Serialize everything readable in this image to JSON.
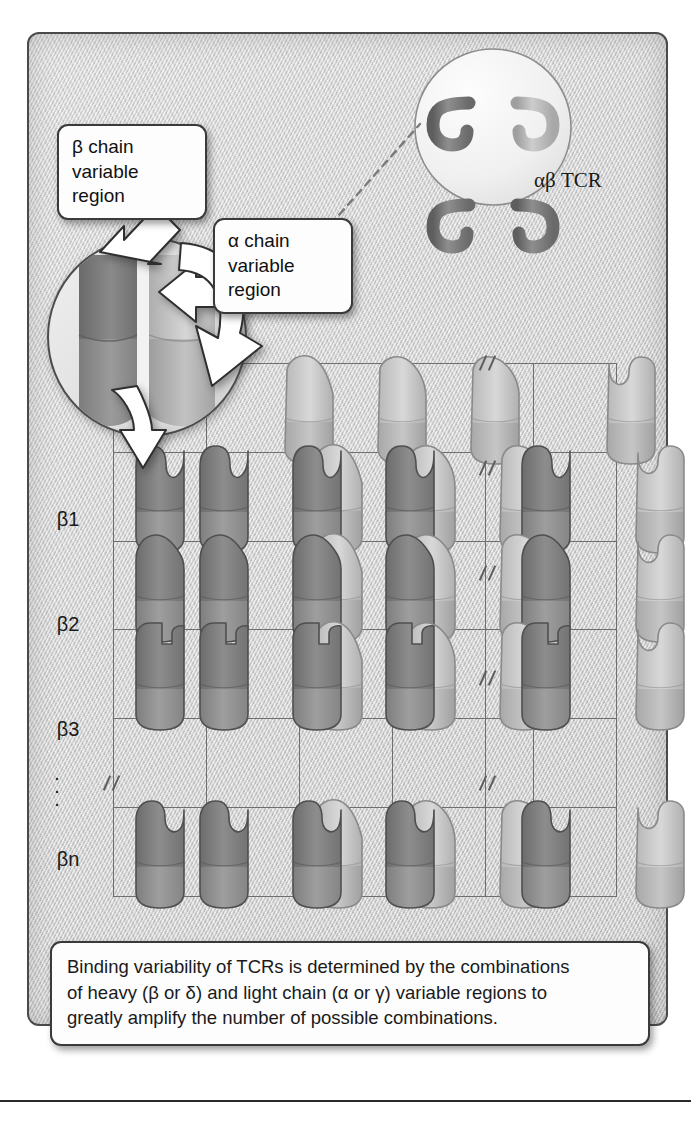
{
  "figure": {
    "tcr_label": "αβ TCR",
    "callouts": [
      {
        "id": "beta-chain-variable-region",
        "line1": "β chain",
        "line2": "variable",
        "line3": "region"
      },
      {
        "id": "alpha-chain-variable-region",
        "line1": "α chain",
        "line2": "variable",
        "line3": "region"
      }
    ],
    "caption": {
      "line1": "Binding variability of TCRs is determined by the combinations",
      "line2": "of heavy (β or δ) and light chain (α or γ) variable regions to",
      "line3": "greatly amplify the number of possible combinations."
    }
  },
  "matrix": {
    "column_headers": [
      "α1",
      "α2",
      "α3",
      ". . .",
      "αn"
    ],
    "row_headers": [
      "β1",
      "β2",
      "β3",
      "⋮",
      "βn"
    ],
    "row_ellipsis": "·\n·\n·",
    "column_ellipsis": ". . .",
    "corner_header": "",
    "description": "6 column by 6 row grid. Column 1 shows beta chains alone; header row 1 shows alpha chains alone; interior cells show paired beta (dark) + alpha (light) variable regions.",
    "cells": [
      {
        "row": "header",
        "col": "alpha1",
        "beta": null,
        "alpha": "a1"
      },
      {
        "row": "header",
        "col": "alpha2",
        "beta": null,
        "alpha": "a2"
      },
      {
        "row": "header",
        "col": "alpha3",
        "beta": null,
        "alpha": "a3"
      },
      {
        "row": "header",
        "col": "break",
        "beta": null,
        "alpha": null
      },
      {
        "row": "header",
        "col": "alphan",
        "beta": null,
        "alpha": "an"
      },
      {
        "row": "beta1",
        "col": "self",
        "beta": "b1",
        "alpha": null
      },
      {
        "row": "beta1",
        "col": "alpha1",
        "beta": "b1",
        "alpha": "a1"
      },
      {
        "row": "beta1",
        "col": "alpha2",
        "beta": "b1",
        "alpha": "a2"
      },
      {
        "row": "beta1",
        "col": "alpha3",
        "beta": "b1",
        "alpha": "a3"
      },
      {
        "row": "beta1",
        "col": "break",
        "beta": null,
        "alpha": null
      },
      {
        "row": "beta1",
        "col": "alphan",
        "beta": "b1",
        "alpha": "an"
      },
      {
        "row": "beta2",
        "col": "self",
        "beta": "b2",
        "alpha": null
      },
      {
        "row": "beta2",
        "col": "alpha1",
        "beta": "b2",
        "alpha": "a1"
      },
      {
        "row": "beta2",
        "col": "alpha2",
        "beta": "b2",
        "alpha": "a2"
      },
      {
        "row": "beta2",
        "col": "alpha3",
        "beta": "b2",
        "alpha": "a3"
      },
      {
        "row": "beta2",
        "col": "break",
        "beta": null,
        "alpha": null
      },
      {
        "row": "beta2",
        "col": "alphan",
        "beta": "b2",
        "alpha": "an"
      },
      {
        "row": "beta3",
        "col": "self",
        "beta": "b3",
        "alpha": null
      },
      {
        "row": "beta3",
        "col": "alpha1",
        "beta": "b3",
        "alpha": "a1"
      },
      {
        "row": "beta3",
        "col": "alpha2",
        "beta": "b3",
        "alpha": "a2"
      },
      {
        "row": "beta3",
        "col": "alpha3",
        "beta": "b3",
        "alpha": "a3"
      },
      {
        "row": "beta3",
        "col": "break",
        "beta": null,
        "alpha": null
      },
      {
        "row": "beta3",
        "col": "alphan",
        "beta": "b3",
        "alpha": "an"
      },
      {
        "row": "betan",
        "col": "self",
        "beta": "bn",
        "alpha": null
      },
      {
        "row": "betan",
        "col": "alpha1",
        "beta": "bn",
        "alpha": "a1"
      },
      {
        "row": "betan",
        "col": "alpha2",
        "beta": "bn",
        "alpha": "a2"
      },
      {
        "row": "betan",
        "col": "alpha3",
        "beta": "bn",
        "alpha": "a3"
      },
      {
        "row": "betan",
        "col": "break",
        "beta": null,
        "alpha": null
      },
      {
        "row": "betan",
        "col": "alphan",
        "beta": "bn",
        "alpha": "an"
      }
    ]
  },
  "colors": {
    "panel_background": "#cfcfcf",
    "panel_border": "#4a4a4a",
    "grid_line": "#6f6f6f",
    "beta_chain_dark": "#7b7b7b",
    "beta_chain_lower": "#8c8c8c",
    "alpha_chain_light": "#c4c4c4",
    "alpha_chain_lower": "#cfcfcf",
    "callout_background": "#fdfdfd",
    "callout_border": "#3a3a3a",
    "arrow_fill": "#ffffff",
    "text": "#1a1a1a"
  }
}
